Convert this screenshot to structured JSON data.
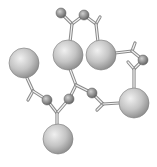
{
  "diagram": {
    "type": "ball-and-stick molecular model",
    "colors": {
      "background": "#ffffff",
      "atom_fill_light": "#e6e6e6",
      "atom_fill_dark": "#8e8e8e",
      "atom_outline": "#7a7a7a",
      "bond_stroke": "#8a8a8a",
      "bond_fill": "#f2f2f2"
    },
    "large_atoms": [
      {
        "id": "L1",
        "x": 24,
        "y": 63,
        "r": 15
      },
      {
        "id": "L2",
        "x": 68,
        "y": 55,
        "r": 15
      },
      {
        "id": "L3",
        "x": 101,
        "y": 55,
        "r": 15
      },
      {
        "id": "L4",
        "x": 134,
        "y": 103,
        "r": 15
      },
      {
        "id": "L5",
        "x": 58,
        "y": 139,
        "r": 15
      }
    ],
    "small_atoms": [
      {
        "id": "S1",
        "x": 61,
        "y": 13,
        "r": 5
      },
      {
        "id": "S2",
        "x": 84,
        "y": 15,
        "r": 5
      },
      {
        "id": "S3",
        "x": 143,
        "y": 60,
        "r": 5
      },
      {
        "id": "S4",
        "x": 47,
        "y": 100,
        "r": 5
      },
      {
        "id": "S5",
        "x": 69,
        "y": 99,
        "r": 5
      },
      {
        "id": "S6",
        "x": 92,
        "y": 93,
        "r": 5
      }
    ],
    "bonds": [
      {
        "x1": 61,
        "y1": 13,
        "x2": 72,
        "y2": 24
      },
      {
        "x1": 72,
        "y1": 24,
        "x2": 84,
        "y2": 15
      },
      {
        "x1": 72,
        "y1": 24,
        "x2": 70,
        "y2": 42
      },
      {
        "x1": 84,
        "y1": 15,
        "x2": 96,
        "y2": 24
      },
      {
        "x1": 96,
        "y1": 24,
        "x2": 100,
        "y2": 17
      },
      {
        "x1": 96,
        "y1": 24,
        "x2": 98,
        "y2": 42
      },
      {
        "x1": 115,
        "y1": 53,
        "x2": 132,
        "y2": 51
      },
      {
        "x1": 132,
        "y1": 51,
        "x2": 135,
        "y2": 43
      },
      {
        "x1": 132,
        "y1": 51,
        "x2": 143,
        "y2": 60
      },
      {
        "x1": 143,
        "y1": 60,
        "x2": 134,
        "y2": 69
      },
      {
        "x1": 134,
        "y1": 69,
        "x2": 128,
        "y2": 62
      },
      {
        "x1": 134,
        "y1": 69,
        "x2": 134,
        "y2": 88
      },
      {
        "x1": 70,
        "y1": 69,
        "x2": 76,
        "y2": 85
      },
      {
        "x1": 76,
        "y1": 85,
        "x2": 69,
        "y2": 99
      },
      {
        "x1": 76,
        "y1": 85,
        "x2": 92,
        "y2": 93
      },
      {
        "x1": 92,
        "y1": 93,
        "x2": 103,
        "y2": 104
      },
      {
        "x1": 103,
        "y1": 104,
        "x2": 97,
        "y2": 110
      },
      {
        "x1": 103,
        "y1": 104,
        "x2": 119,
        "y2": 103
      },
      {
        "x1": 27,
        "y1": 78,
        "x2": 33,
        "y2": 91
      },
      {
        "x1": 33,
        "y1": 91,
        "x2": 28,
        "y2": 100
      },
      {
        "x1": 33,
        "y1": 91,
        "x2": 47,
        "y2": 100
      },
      {
        "x1": 47,
        "y1": 100,
        "x2": 57,
        "y2": 113
      },
      {
        "x1": 57,
        "y1": 113,
        "x2": 69,
        "y2": 99
      },
      {
        "x1": 57,
        "y1": 113,
        "x2": 57,
        "y2": 124
      }
    ]
  }
}
